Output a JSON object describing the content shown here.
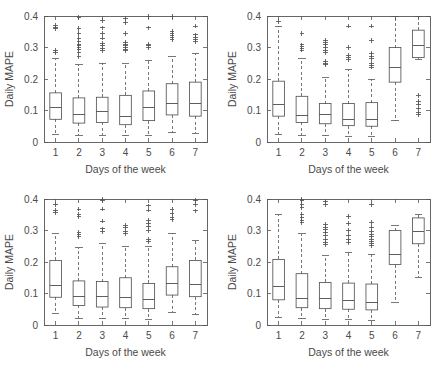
{
  "figure": {
    "background": "#ffffff",
    "line_color": "#555555",
    "text_color": "#4a4a4a",
    "panel_count": 4,
    "layout": "2x2 grid of boxplots"
  },
  "axes": {
    "ylabel": "Daily MAPE",
    "xlabel": "Days of the week",
    "yticks": [
      "0",
      "0.1",
      "0.2",
      "0.3",
      "0.4"
    ],
    "ytick_values": [
      0,
      0.1,
      0.2,
      0.3,
      0.4
    ],
    "xticks": [
      "1",
      "2",
      "3",
      "4",
      "5",
      "6",
      "7"
    ],
    "ylim": [
      0,
      0.4
    ],
    "xlim": [
      0.5,
      7.5
    ]
  },
  "chart_data": [
    {
      "type": "box",
      "panel": "top-left",
      "title": "",
      "xlabel": "Days of the week",
      "ylabel": "Daily MAPE",
      "ylim": [
        0,
        0.4
      ],
      "grid": false,
      "legend": "none",
      "categories": [
        "1",
        "2",
        "3",
        "4",
        "5",
        "6",
        "7"
      ],
      "boxes": [
        {
          "category": "1",
          "whisker_low": 0.025,
          "q1": 0.072,
          "median": 0.108,
          "q3": 0.156,
          "whisker_high": 0.265,
          "outliers": [
            0.285,
            0.29,
            0.36,
            0.365,
            0.37
          ]
        },
        {
          "category": "2",
          "whisker_low": 0.022,
          "q1": 0.06,
          "median": 0.088,
          "q3": 0.14,
          "whisker_high": 0.245,
          "outliers": [
            0.27,
            0.285,
            0.295,
            0.3,
            0.305,
            0.31,
            0.318,
            0.33,
            0.345,
            0.36,
            0.395
          ]
        },
        {
          "category": "3",
          "whisker_low": 0.022,
          "q1": 0.062,
          "median": 0.097,
          "q3": 0.142,
          "whisker_high": 0.25,
          "outliers": [
            0.29,
            0.298,
            0.305,
            0.312,
            0.33,
            0.345,
            0.362,
            0.385
          ]
        },
        {
          "category": "4",
          "whisker_low": 0.02,
          "q1": 0.055,
          "median": 0.08,
          "q3": 0.148,
          "whisker_high": 0.248,
          "outliers": [
            0.29,
            0.295,
            0.3,
            0.305,
            0.31,
            0.315,
            0.345,
            0.38,
            0.392
          ]
        },
        {
          "category": "5",
          "whisker_low": 0.022,
          "q1": 0.068,
          "median": 0.108,
          "q3": 0.162,
          "whisker_high": 0.258,
          "outliers": [
            0.3,
            0.305,
            0.31,
            0.362,
            0.398
          ]
        },
        {
          "category": "6",
          "whisker_low": 0.03,
          "q1": 0.086,
          "median": 0.121,
          "q3": 0.185,
          "whisker_high": 0.27,
          "outliers": [
            0.325,
            0.332,
            0.338,
            0.345,
            0.352,
            0.398
          ]
        },
        {
          "category": "7",
          "whisker_low": 0.028,
          "q1": 0.082,
          "median": 0.122,
          "q3": 0.19,
          "whisker_high": 0.282,
          "outliers": [
            0.318,
            0.325,
            0.332,
            0.34,
            0.368
          ]
        }
      ]
    },
    {
      "type": "box",
      "panel": "top-right",
      "title": "",
      "xlabel": "Days of the week",
      "ylabel": "Daily MAPE",
      "ylim": [
        0,
        0.4
      ],
      "grid": false,
      "legend": "none",
      "categories": [
        "1",
        "2",
        "3",
        "4",
        "5",
        "6",
        "7"
      ],
      "boxes": [
        {
          "category": "1",
          "whisker_low": 0.025,
          "q1": 0.082,
          "median": 0.118,
          "q3": 0.193,
          "whisker_high": 0.368,
          "outliers": [
            0.383
          ]
        },
        {
          "category": "2",
          "whisker_low": 0.022,
          "q1": 0.062,
          "median": 0.085,
          "q3": 0.145,
          "whisker_high": 0.265,
          "outliers": [
            0.292,
            0.298,
            0.302,
            0.308,
            0.345
          ]
        },
        {
          "category": "3",
          "whisker_low": 0.02,
          "q1": 0.058,
          "median": 0.086,
          "q3": 0.122,
          "whisker_high": 0.205,
          "outliers": [
            0.245,
            0.25,
            0.255,
            0.285,
            0.292,
            0.3,
            0.308,
            0.315,
            0.322
          ]
        },
        {
          "category": "4",
          "whisker_low": 0.018,
          "q1": 0.052,
          "median": 0.07,
          "q3": 0.122,
          "whisker_high": 0.23,
          "outliers": [
            0.262,
            0.268,
            0.275,
            0.3,
            0.368
          ]
        },
        {
          "category": "5",
          "whisker_low": 0.018,
          "q1": 0.05,
          "median": 0.073,
          "q3": 0.125,
          "whisker_high": 0.2,
          "outliers": [
            0.238,
            0.243,
            0.25,
            0.265,
            0.272,
            0.28,
            0.322,
            0.368
          ]
        },
        {
          "category": "6",
          "whisker_low": 0.068,
          "q1": 0.19,
          "median": 0.235,
          "q3": 0.3,
          "whisker_high": 0.398,
          "outliers": []
        },
        {
          "category": "7",
          "whisker_low": 0.262,
          "q1": 0.268,
          "median": 0.305,
          "q3": 0.355,
          "whisker_high": 0.398,
          "outliers": [
            0.088,
            0.095,
            0.105,
            0.118,
            0.128,
            0.148
          ]
        }
      ]
    },
    {
      "type": "box",
      "panel": "bottom-left",
      "title": "",
      "xlabel": "Days of the week",
      "ylabel": "Daily MAPE",
      "ylim": [
        0,
        0.4
      ],
      "grid": false,
      "legend": "none",
      "categories": [
        "1",
        "2",
        "3",
        "4",
        "5",
        "6",
        "7"
      ],
      "boxes": [
        {
          "category": "1",
          "whisker_low": 0.038,
          "q1": 0.088,
          "median": 0.125,
          "q3": 0.205,
          "whisker_high": 0.29,
          "outliers": [
            0.358,
            0.365,
            0.382
          ]
        },
        {
          "category": "2",
          "whisker_low": 0.022,
          "q1": 0.062,
          "median": 0.09,
          "q3": 0.14,
          "whisker_high": 0.245,
          "outliers": [
            0.282,
            0.288,
            0.295,
            0.345,
            0.352,
            0.368
          ]
        },
        {
          "category": "3",
          "whisker_low": 0.02,
          "q1": 0.057,
          "median": 0.09,
          "q3": 0.138,
          "whisker_high": 0.258,
          "outliers": [
            0.298,
            0.305,
            0.33,
            0.368,
            0.395,
            0.398
          ]
        },
        {
          "category": "4",
          "whisker_low": 0.02,
          "q1": 0.055,
          "median": 0.086,
          "q3": 0.15,
          "whisker_high": 0.248,
          "outliers": [
            0.29,
            0.298,
            0.31,
            0.315
          ]
        },
        {
          "category": "5",
          "whisker_low": 0.018,
          "q1": 0.052,
          "median": 0.08,
          "q3": 0.132,
          "whisker_high": 0.248,
          "outliers": [
            0.265,
            0.272,
            0.3,
            0.312,
            0.322,
            0.332,
            0.365,
            0.378
          ]
        },
        {
          "category": "6",
          "whisker_low": 0.04,
          "q1": 0.095,
          "median": 0.132,
          "q3": 0.185,
          "whisker_high": 0.292,
          "outliers": [
            0.335,
            0.342,
            0.355,
            0.368
          ]
        },
        {
          "category": "7",
          "whisker_low": 0.032,
          "q1": 0.09,
          "median": 0.13,
          "q3": 0.205,
          "whisker_high": 0.268,
          "outliers": [
            0.362,
            0.383,
            0.395
          ]
        }
      ]
    },
    {
      "type": "box",
      "panel": "bottom-right",
      "title": "",
      "xlabel": "Days of the week",
      "ylabel": "Daily MAPE",
      "ylim": [
        0,
        0.4
      ],
      "grid": false,
      "legend": "none",
      "categories": [
        "1",
        "2",
        "3",
        "4",
        "5",
        "6",
        "7"
      ],
      "boxes": [
        {
          "category": "1",
          "whisker_low": 0.025,
          "q1": 0.08,
          "median": 0.122,
          "q3": 0.208,
          "whisker_high": 0.35,
          "outliers": []
        },
        {
          "category": "2",
          "whisker_low": 0.02,
          "q1": 0.055,
          "median": 0.085,
          "q3": 0.163,
          "whisker_high": 0.29,
          "outliers": [
            0.325,
            0.332,
            0.34,
            0.352,
            0.372,
            0.382,
            0.395,
            0.398
          ]
        },
        {
          "category": "3",
          "whisker_low": 0.018,
          "q1": 0.052,
          "median": 0.085,
          "q3": 0.135,
          "whisker_high": 0.22,
          "outliers": [
            0.255,
            0.262,
            0.27,
            0.285,
            0.295,
            0.302,
            0.31,
            0.318,
            0.382,
            0.392
          ]
        },
        {
          "category": "4",
          "whisker_low": 0.018,
          "q1": 0.05,
          "median": 0.078,
          "q3": 0.133,
          "whisker_high": 0.23,
          "outliers": [
            0.262,
            0.27,
            0.285,
            0.3,
            0.322,
            0.345
          ]
        },
        {
          "category": "5",
          "whisker_low": 0.015,
          "q1": 0.048,
          "median": 0.07,
          "q3": 0.13,
          "whisker_high": 0.225,
          "outliers": [
            0.252,
            0.258,
            0.265,
            0.272,
            0.28,
            0.288,
            0.298,
            0.31,
            0.325,
            0.382
          ]
        },
        {
          "category": "6",
          "whisker_low": 0.072,
          "q1": 0.192,
          "median": 0.225,
          "q3": 0.3,
          "whisker_high": 0.315,
          "outliers": []
        },
        {
          "category": "7",
          "whisker_low": 0.152,
          "q1": 0.258,
          "median": 0.298,
          "q3": 0.34,
          "whisker_high": 0.352,
          "outliers": []
        }
      ]
    }
  ]
}
